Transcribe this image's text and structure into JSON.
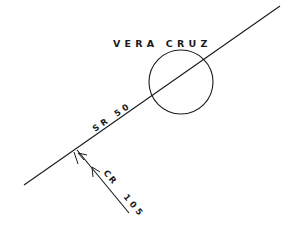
{
  "diagram": {
    "background": "#ffffff",
    "stroke_color": "#1a1a1a",
    "town": {
      "label": "VERA CRUZ",
      "circle": {
        "cx": 181,
        "cy": 82,
        "r": 32
      }
    },
    "roads": [
      {
        "id": "sr50",
        "label": "SR 50",
        "from": [
          24,
          185
        ],
        "to": [
          280,
          6
        ]
      },
      {
        "id": "cr105",
        "label_a": "CR",
        "label_b": "105",
        "from": [
          77,
          150
        ],
        "to": [
          129,
          213
        ]
      }
    ]
  }
}
